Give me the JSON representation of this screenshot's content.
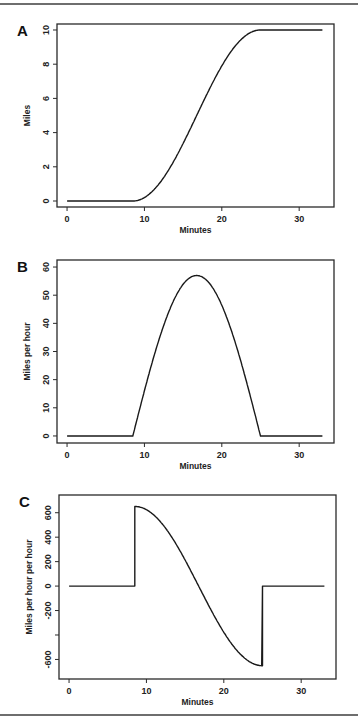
{
  "chart_data": [
    {
      "panel": "A",
      "type": "line",
      "title": "",
      "xlabel": "Minutes",
      "ylabel": "Miles",
      "xticks": [
        0,
        10,
        20,
        30
      ],
      "yticks": [
        0,
        2,
        4,
        6,
        8,
        10
      ],
      "ytick_labels": [
        "0",
        "2",
        "4",
        "6",
        "8",
        "10"
      ],
      "xlim": [
        -1.3,
        34.5
      ],
      "ylim": [
        -0.35,
        10.35
      ],
      "grid": false,
      "series": [
        {
          "name": "distance",
          "x": [
            0,
            8.5,
            10,
            12,
            14,
            16,
            16.75,
            18,
            20,
            22,
            24,
            25,
            33
          ],
          "y": [
            0,
            0,
            0.13,
            0.86,
            2.14,
            3.86,
            5.0,
            6.46,
            8.32,
            9.55,
            9.98,
            10,
            10
          ]
        }
      ]
    },
    {
      "panel": "B",
      "type": "line",
      "title": "",
      "xlabel": "Minutes",
      "ylabel": "Miles per hour",
      "xticks": [
        0,
        10,
        20,
        30
      ],
      "yticks": [
        0,
        10,
        20,
        30,
        40,
        50,
        60
      ],
      "ytick_labels": [
        "0",
        "10",
        "20",
        "30",
        "40",
        "50",
        "60"
      ],
      "xlim": [
        -1.3,
        34.5
      ],
      "ylim": [
        -2.5,
        62.5
      ],
      "grid": false,
      "series": [
        {
          "name": "velocity",
          "x": [
            0,
            8.5,
            10,
            12,
            14,
            16,
            16.75,
            18,
            20,
            22,
            24,
            25,
            33
          ],
          "y": [
            0,
            0,
            16.0,
            37.0,
            51.1,
            56.6,
            57.0,
            55.6,
            48.6,
            37.0,
            16.0,
            0,
            0
          ]
        }
      ]
    },
    {
      "panel": "C",
      "type": "line",
      "title": "",
      "xlabel": "Minutes",
      "ylabel": "Miles per hour per hour",
      "xticks": [
        0,
        10,
        20,
        30
      ],
      "yticks": [
        -600,
        -400,
        -200,
        0,
        200,
        400,
        600
      ],
      "ytick_labels": [
        "-600",
        "",
        "-200",
        "0",
        "200",
        "400",
        "600"
      ],
      "xlim": [
        -1.3,
        34.5
      ],
      "ylim": [
        -760,
        745
      ],
      "grid": false,
      "series": [
        {
          "name": "acceleration",
          "x": [
            0,
            8.5,
            8.5,
            10,
            12,
            14,
            16,
            16.75,
            18,
            20,
            22,
            24,
            25,
            25,
            33
          ],
          "y": [
            0,
            0,
            651,
            622,
            518,
            366,
            147,
            0,
            -210,
            -440,
            -594,
            -651,
            -651,
            0,
            0
          ]
        }
      ]
    }
  ],
  "panels": [
    {
      "letter": "A",
      "xlabel": "Minutes",
      "ylabel": "Miles"
    },
    {
      "letter": "B",
      "xlabel": "Minutes",
      "ylabel": "Miles per hour"
    },
    {
      "letter": "C",
      "xlabel": "Minutes",
      "ylabel": "Miles per hour per hour"
    }
  ],
  "model": {
    "start_min": 8.5,
    "end_min": 25,
    "peak_mph": 57,
    "total_miles": 10,
    "end_x": 33
  },
  "colors": {
    "line": "#1a1a1a",
    "frame": "#2a2a2a",
    "rule": "#6e6e6e"
  }
}
